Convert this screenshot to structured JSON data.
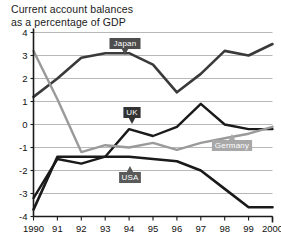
{
  "title": {
    "line1": "Current account balances",
    "line2": "as a percentage of GDP"
  },
  "chart_data": {
    "type": "line",
    "title": "Current account balances as a percentage of GDP",
    "xlabel": "",
    "ylabel": "",
    "xlim": [
      1990,
      2000
    ],
    "ylim": [
      -4,
      4
    ],
    "grid": true,
    "legend_position": "inline-callouts",
    "x": [
      1990,
      1991,
      1992,
      1993,
      1994,
      1995,
      1996,
      1997,
      1998,
      1999,
      2000
    ],
    "xtick_labels": [
      "1990",
      "91",
      "92",
      "93",
      "94",
      "95",
      "96",
      "97",
      "98",
      "99",
      "2000"
    ],
    "ytick_labels": [
      "4",
      "3",
      "2",
      "1",
      "0",
      "-1",
      "-2",
      "-3",
      "-4"
    ],
    "ytick_values": [
      4,
      3,
      2,
      1,
      0,
      -1,
      -2,
      -3,
      -4
    ],
    "series": [
      {
        "name": "Japan",
        "color": "#3a3a3a",
        "width": 2.6,
        "values": [
          1.2,
          2.0,
          2.9,
          3.1,
          3.1,
          2.6,
          1.4,
          2.2,
          3.2,
          3.0,
          3.5
        ]
      },
      {
        "name": "UK",
        "color": "#1a1a1a",
        "width": 2.4,
        "values": [
          -3.2,
          -1.5,
          -1.7,
          -1.4,
          -0.2,
          -0.5,
          -0.1,
          0.9,
          0.0,
          -0.2,
          -0.2
        ]
      },
      {
        "name": "Germany",
        "color": "#9a9a9a",
        "width": 2.4,
        "values": [
          3.2,
          1.1,
          -1.2,
          -0.9,
          -1.0,
          -0.8,
          -1.1,
          -0.8,
          -0.6,
          -0.4,
          -0.1
        ]
      },
      {
        "name": "USA",
        "color": "#1a1a1a",
        "width": 2.6,
        "values": [
          -3.7,
          -1.4,
          -1.4,
          -1.4,
          -1.4,
          -1.5,
          -1.6,
          -2.0,
          -2.8,
          -3.6,
          -3.6
        ]
      }
    ],
    "callouts": [
      {
        "label": "Japan",
        "box_fill": "#4d4d4d",
        "text_color": "#ffffff"
      },
      {
        "label": "UK",
        "box_fill": "#333333",
        "text_color": "#ffffff"
      },
      {
        "label": "Germany",
        "box_fill": "#a8a8a8",
        "text_color": "#ffffff"
      },
      {
        "label": "USA",
        "box_fill": "#5a5a5a",
        "text_color": "#ffffff"
      }
    ]
  },
  "caption": ""
}
